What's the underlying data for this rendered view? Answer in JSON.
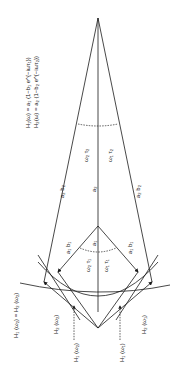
{
  "figure": {
    "equations": [
      "H₁(ω) = a₁ (1−b₁ e^{−iωτ₁})",
      "H₂(ω) = a₂ (1−b₂ e^{−iωτ₂})"
    ],
    "labels": {
      "omega2_tau2_top": "ω₂ τ₂",
      "omega1_tau2_top": "ω₁ τ₂",
      "a2b2_left": "a₂ b₂",
      "a2_center": "a₂",
      "a2b2_right": "a₂ b₂",
      "a1b1_left": "a₁ b₁",
      "a1_center": "a₁",
      "a1b1_right": "a₁ b₁",
      "omega2_tau1": "ω₂ τ₁",
      "omega1_tau1": "ω₁ τ₁",
      "h1w2_eq_h2w2": "H₁ (ω₂) = H₂ (ω₂)",
      "h2w2": "H₂ (ω₂)",
      "h1w2": "H₁ (ω₂)",
      "h1w1": "H₁ (ω₁)",
      "h2w1": "H₂ (ω₁)"
    },
    "colors": {
      "line": "#1a1a1a",
      "background": "#ffffff"
    }
  }
}
